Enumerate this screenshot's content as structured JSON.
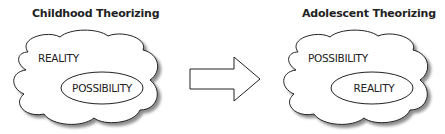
{
  "panels": [
    {
      "title": "Childhood Theorizing",
      "outer_label": "REALITY",
      "inner_label": "POSSIBILITY"
    },
    {
      "title": "Adolescent Theorizing",
      "outer_label": "POSSIBILITY",
      "inner_label": "REALITY"
    }
  ],
  "arrow": {
    "direction": "right"
  }
}
